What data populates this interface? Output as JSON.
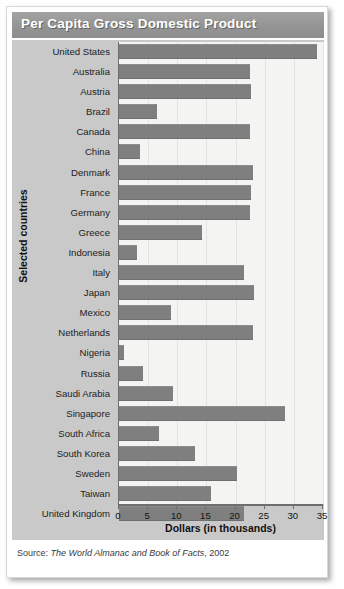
{
  "title": "Per Capita Gross Domestic Product",
  "source": {
    "prefix": "Source:",
    "work": "The World Almanac and Book of Facts",
    "year": ", 2002"
  },
  "colors": {
    "bar": "#7f7f7f",
    "titlebar": "#949494",
    "panel": "#c9c9c9",
    "plot_bg": "#f4f4f3",
    "axis": "#6e6e6e"
  },
  "chart_data": {
    "type": "bar",
    "orientation": "horizontal",
    "title": "Per Capita Gross Domestic Product",
    "xlabel": "Dollars (in thousands)",
    "ylabel": "Selected countries",
    "xlim": [
      0,
      35
    ],
    "xticks": [
      0,
      5,
      10,
      15,
      20,
      25,
      30,
      35
    ],
    "xtick_labels": [
      "0",
      "5",
      "10",
      "15",
      "20",
      "25",
      "30",
      "35"
    ],
    "grid": true,
    "legend": null,
    "units": "thousands of US dollars",
    "categories": [
      "United States",
      "Australia",
      "Austria",
      "Brazil",
      "Canada",
      "China",
      "Denmark",
      "France",
      "Germany",
      "Greece",
      "Indonesia",
      "Italy",
      "Japan",
      "Mexico",
      "Netherlands",
      "Nigeria",
      "Russia",
      "Saudi Arabia",
      "Singapore",
      "South Africa",
      "South Korea",
      "Sweden",
      "Taiwan",
      "United Kingdom"
    ],
    "values": [
      33.9,
      22.4,
      22.7,
      6.5,
      22.4,
      3.6,
      23.0,
      22.6,
      22.4,
      14.3,
      3.1,
      21.4,
      23.1,
      9.0,
      23.0,
      0.9,
      4.2,
      9.2,
      28.5,
      6.9,
      13.1,
      20.3,
      15.7,
      21.5
    ]
  }
}
